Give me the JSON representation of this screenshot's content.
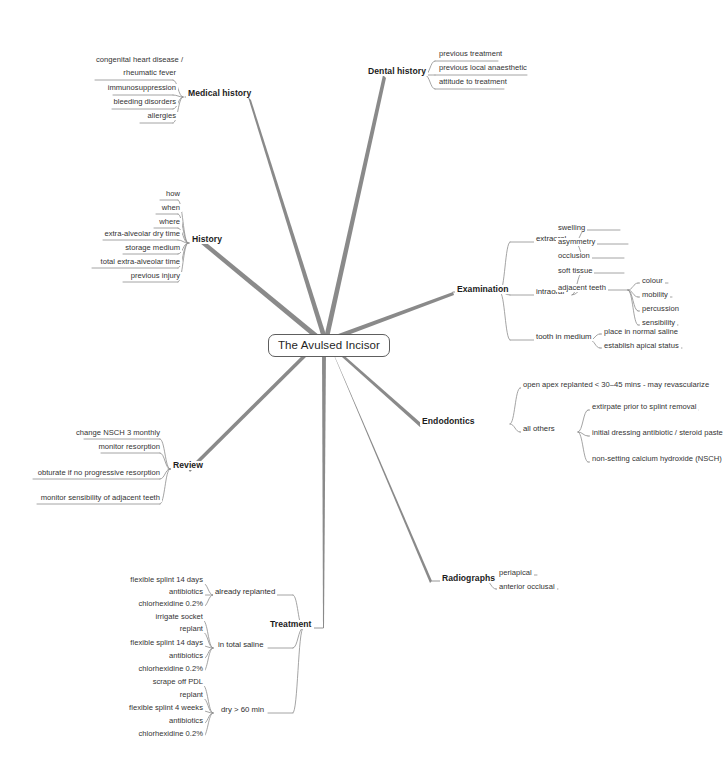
{
  "diagram": {
    "type": "mind-map",
    "title": "The Avulsed Incisor",
    "center": {
      "label": "The Avulsed Incisor"
    },
    "line_color": "#7d7d7d",
    "leaf_line_color": "#8a8a8a",
    "text_color": "#2b2b2b",
    "background": "#ffffff"
  },
  "branches": {
    "medical_history": {
      "label": "Medical history",
      "leaves": [
        "congenital heart disease /",
        "rheumatic fever",
        "immunosuppression",
        "bleeding disorders",
        "allergies"
      ]
    },
    "dental_history": {
      "label": "Dental history",
      "leaves": [
        "previous treatment",
        "previous local anaesthetic",
        "attitude to treatment"
      ]
    },
    "history": {
      "label": "History",
      "leaves": [
        "how",
        "when",
        "where",
        "extra-alveolar dry time",
        "storage medium",
        "total extra-alveolar time",
        "previous injury"
      ]
    },
    "examination": {
      "label": "Examination",
      "groups": [
        {
          "name": "extraoral",
          "leaves": [
            "swelling",
            "asymmetry",
            "occlusion"
          ]
        },
        {
          "name": "intraoral",
          "leaves": [
            "soft tissue",
            "adjacent teeth"
          ],
          "sub": {
            "parent": "adjacent teeth",
            "leaves": [
              "colour",
              "mobility",
              "percussion",
              "sensibility"
            ]
          }
        },
        {
          "name": "tooth in medium",
          "leaves": [
            "place in normal saline",
            "establish apical status"
          ]
        }
      ]
    },
    "endodontics": {
      "label": "Endodontics",
      "top_leaf": "open apex replanted < 30–45 mins - may revascularize",
      "groups": [
        {
          "name": "all others",
          "leaves": [
            "extirpate prior to splint removal",
            "initial dressing antibiotic / steroid paste",
            "non-setting calcium hydroxide (NSCH)"
          ]
        }
      ]
    },
    "radiographs": {
      "label": "Radiographs",
      "leaves": [
        "periapical",
        "anterior occlusal"
      ]
    },
    "review": {
      "label": "Review",
      "leaves": [
        "change NSCH 3 monthly",
        "monitor resorption",
        "obturate if no progressive resorption",
        "monitor sensibility of adjacent teeth"
      ]
    },
    "treatment": {
      "label": "Treatment",
      "groups": [
        {
          "name": "already replanted",
          "leaves": [
            "flexible splint 14 days",
            "antibiotics",
            "chlorhexidine 0.2%"
          ]
        },
        {
          "name": "in total saline",
          "leaves": [
            "irrigate socket",
            "replant",
            "flexible splint 14 days",
            "antibiotics",
            "chlorhexidine 0.2%"
          ]
        },
        {
          "name": "dry > 60 min",
          "leaves": [
            "scrape off PDL",
            "replant",
            "flexible splint 4 weeks",
            "antibiotics",
            "chlorhexidine 0.2%"
          ]
        }
      ]
    }
  }
}
